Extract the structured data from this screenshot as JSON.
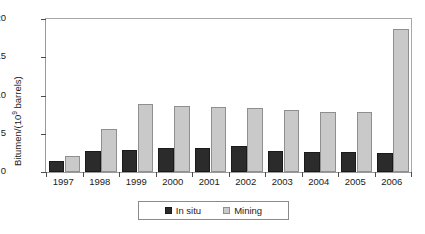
{
  "chart_data": {
    "type": "bar",
    "title": "",
    "subtitle": "",
    "xlabel": "",
    "ylabel": "Bitumen/(10⁹ barrels)",
    "ylabel_parts": {
      "prefix": "Bitumen/(10",
      "exponent": "9",
      "suffix": " barrels)"
    },
    "categories": [
      "1997",
      "1998",
      "1999",
      "2000",
      "2001",
      "2002",
      "2003",
      "2004",
      "2005",
      "2006"
    ],
    "series": [
      {
        "name": "In situ",
        "color": "#2b2b2b",
        "values": [
          1.5,
          2.8,
          2.9,
          3.1,
          3.1,
          3.4,
          2.8,
          2.6,
          2.6,
          2.5
        ]
      },
      {
        "name": "Mining",
        "color": "#c9c9c9",
        "values": [
          2.1,
          5.6,
          8.9,
          8.6,
          8.5,
          8.4,
          8.1,
          7.9,
          7.8,
          18.7
        ]
      }
    ],
    "ylim": [
      0,
      20
    ],
    "yticks": [
      0,
      5,
      10,
      15,
      20
    ],
    "ytick_labels": [
      "0",
      "5",
      "10",
      "15",
      "20"
    ],
    "grid": false,
    "legend_position": "bottom-center",
    "legend_entries": [
      "In situ",
      "Mining"
    ]
  }
}
